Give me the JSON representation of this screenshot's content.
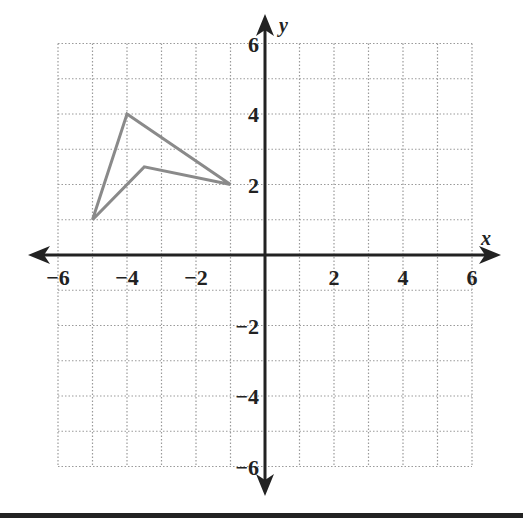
{
  "chart_data": {
    "type": "line",
    "title": "",
    "xlabel": "x",
    "ylabel": "y",
    "xlim": [
      -6,
      6
    ],
    "ylim": [
      -6,
      6
    ],
    "grid": true,
    "grid_style": "dotted",
    "grid_step": 1,
    "x_ticks": [
      -6,
      -4,
      -2,
      2,
      4,
      6
    ],
    "y_ticks": [
      -6,
      -4,
      -2,
      2,
      4,
      6
    ],
    "x_tick_labels": [
      "−6",
      "−4",
      "−2",
      "2",
      "4",
      "6"
    ],
    "y_tick_labels": [
      "−6",
      "−4",
      "−2",
      "2",
      "4",
      "6"
    ],
    "series": [
      {
        "name": "quadrilateral",
        "closed": true,
        "color": "#8a8a8a",
        "points": [
          [
            -4,
            4
          ],
          [
            -1,
            2
          ],
          [
            -3.5,
            2.5
          ],
          [
            -5,
            1
          ]
        ]
      }
    ],
    "legend": null
  },
  "colors": {
    "axis": "#222222",
    "grid": "#9a9a9a",
    "shape": "#8a8a8a"
  }
}
